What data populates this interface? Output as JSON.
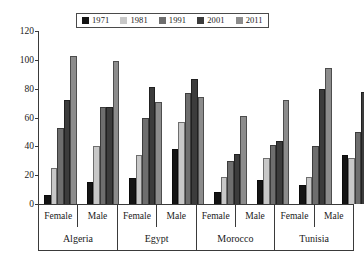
{
  "chart_data": {
    "type": "bar",
    "title": "",
    "subtitle": "",
    "xlabel": "",
    "ylabel": "",
    "ylim": [
      0,
      120
    ],
    "yticks": [
      0,
      20,
      40,
      60,
      80,
      100,
      120
    ],
    "grid": false,
    "legend_position": "top",
    "categories": [
      "Algeria Female",
      "Algeria Male",
      "Egypt Female",
      "Egypt Male",
      "Morocco Female",
      "Morocco Male",
      "Tunisia Female",
      "Tunisia Male"
    ],
    "countries": [
      "Algeria",
      "Egypt",
      "Morocco",
      "Tunisia"
    ],
    "subcategories": [
      "Female",
      "Male"
    ],
    "series": [
      {
        "name": "1971",
        "color": "#141414",
        "values": [
          6,
          15,
          18,
          38,
          8,
          17,
          13,
          34
        ]
      },
      {
        "name": "1981",
        "color": "#c8c8c8",
        "values": [
          25,
          40,
          34,
          57,
          19,
          32,
          19,
          32
        ]
      },
      {
        "name": "1991",
        "color": "#6e6e6e",
        "values": [
          53,
          67,
          60,
          77,
          30,
          41,
          40,
          50
        ]
      },
      {
        "name": "2001",
        "color": "#3c3c3c",
        "values": [
          72,
          67,
          81,
          87,
          35,
          44,
          80,
          78
        ]
      },
      {
        "name": "2011",
        "color": "#8c8c8c",
        "values": [
          103,
          99,
          71,
          74,
          61,
          72,
          94,
          92
        ]
      }
    ]
  },
  "legend": {
    "items": [
      {
        "label": "1971",
        "color": "#141414"
      },
      {
        "label": "1981",
        "color": "#c8c8c8"
      },
      {
        "label": "1991",
        "color": "#6e6e6e"
      },
      {
        "label": "2001",
        "color": "#3c3c3c"
      },
      {
        "label": "2011",
        "color": "#8c8c8c"
      }
    ]
  },
  "axis": {
    "y_labels": [
      "120",
      "100",
      "80",
      "60",
      "40",
      "20",
      "0"
    ],
    "sub_labels": [
      "Female",
      "Male",
      "Female",
      "Male",
      "Female",
      "Male",
      "Female",
      "Male"
    ],
    "country_labels": [
      "Algeria",
      "Egypt",
      "Morocco",
      "Tunisia"
    ]
  }
}
